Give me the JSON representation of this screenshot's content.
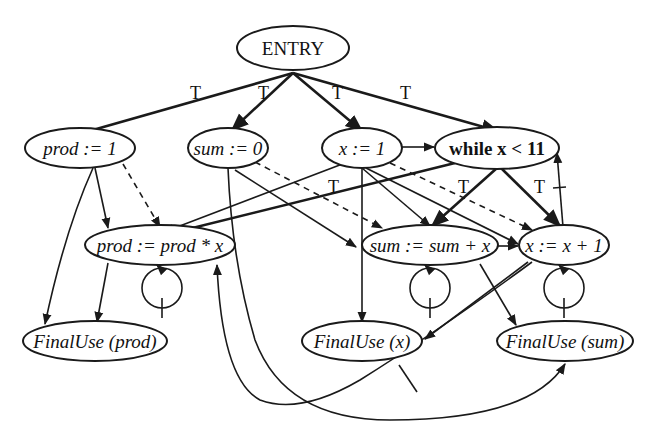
{
  "diagram": {
    "type": "program dependence graph",
    "nodes": {
      "entry": {
        "label": "ENTRY"
      },
      "prod_init": {
        "label": "prod := 1"
      },
      "sum_init": {
        "label": "sum := 0"
      },
      "x_init": {
        "label": "x := 1"
      },
      "while": {
        "label": "while x < 11"
      },
      "prod_update": {
        "label": "prod := prod * x"
      },
      "sum_update": {
        "label": "sum := sum + x"
      },
      "x_update": {
        "label": "x := x + 1"
      },
      "finaluse_prod": {
        "label": "FinalUse (prod)"
      },
      "finaluse_x": {
        "label": "FinalUse (x)"
      },
      "finaluse_sum": {
        "label": "FinalUse (sum)"
      }
    },
    "edge_labels": {
      "t1": "T",
      "t2": "T",
      "t3": "T",
      "t4": "T",
      "t5": "T",
      "t6": "T",
      "t7": "T"
    },
    "edges": [
      {
        "from": "entry",
        "to": "prod_init",
        "kind": "control",
        "label": "T"
      },
      {
        "from": "entry",
        "to": "sum_init",
        "kind": "control",
        "label": "T"
      },
      {
        "from": "entry",
        "to": "x_init",
        "kind": "control",
        "label": "T"
      },
      {
        "from": "entry",
        "to": "while",
        "kind": "control",
        "label": "T"
      },
      {
        "from": "while",
        "to": "prod_update",
        "kind": "control",
        "label": "T"
      },
      {
        "from": "while",
        "to": "sum_update",
        "kind": "control",
        "label": "T"
      },
      {
        "from": "while",
        "to": "x_update",
        "kind": "control",
        "label": "T"
      },
      {
        "from": "x_init",
        "to": "while",
        "kind": "flow"
      },
      {
        "from": "x_update",
        "to": "while",
        "kind": "flow",
        "loop_carried": true
      },
      {
        "from": "prod_init",
        "to": "prod_update",
        "kind": "flow"
      },
      {
        "from": "prod_init",
        "to": "finaluse_prod",
        "kind": "flow"
      },
      {
        "from": "prod_update",
        "to": "finaluse_prod",
        "kind": "flow"
      },
      {
        "from": "prod_update",
        "to": "prod_update",
        "kind": "flow",
        "loop_carried": true
      },
      {
        "from": "sum_init",
        "to": "sum_update",
        "kind": "flow"
      },
      {
        "from": "sum_init",
        "to": "finaluse_sum",
        "kind": "flow"
      },
      {
        "from": "sum_update",
        "to": "finaluse_sum",
        "kind": "flow"
      },
      {
        "from": "sum_update",
        "to": "sum_update",
        "kind": "flow",
        "loop_carried": true
      },
      {
        "from": "sum_update",
        "to": "x_update",
        "kind": "def-order"
      },
      {
        "from": "x_init",
        "to": "prod_update",
        "kind": "flow"
      },
      {
        "from": "x_init",
        "to": "sum_update",
        "kind": "flow"
      },
      {
        "from": "x_init",
        "to": "x_update",
        "kind": "flow"
      },
      {
        "from": "x_init",
        "to": "finaluse_x",
        "kind": "flow"
      },
      {
        "from": "x_update",
        "to": "finaluse_x",
        "kind": "flow"
      },
      {
        "from": "x_update",
        "to": "x_update",
        "kind": "flow",
        "loop_carried": true
      },
      {
        "from": "x_update",
        "to": "prod_update",
        "kind": "flow",
        "loop_carried": true
      },
      {
        "from": "prod_init",
        "to": "prod_update",
        "kind": "def-order"
      },
      {
        "from": "sum_init",
        "to": "sum_update",
        "kind": "def-order"
      },
      {
        "from": "x_init",
        "to": "x_update",
        "kind": "def-order"
      }
    ]
  }
}
